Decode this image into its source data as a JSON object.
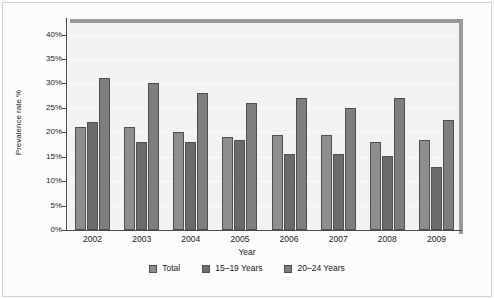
{
  "chart_data": {
    "type": "bar",
    "title": "",
    "subtitle": "",
    "xlabel": "Year",
    "ylabel": "Prevalence rate %",
    "categories": [
      "2002",
      "2003",
      "2004",
      "2005",
      "2006",
      "2007",
      "2008",
      "2009"
    ],
    "ytick_labels": [
      "0%",
      "5%",
      "10%",
      "15%",
      "20%",
      "25%",
      "30%",
      "35%",
      "40%"
    ],
    "ytick_values": [
      0,
      5,
      10,
      15,
      20,
      25,
      30,
      35,
      40
    ],
    "ylim": [
      0,
      43
    ],
    "grid": true,
    "legend_position": "bottom",
    "series": [
      {
        "name": "Total",
        "color": "#8e8e8e",
        "values": [
          21.0,
          21.0,
          20.0,
          19.0,
          19.5,
          19.5,
          18.0,
          18.5
        ]
      },
      {
        "name": "15–19 Years",
        "color": "#6b6b6b",
        "values": [
          22.2,
          18.0,
          18.0,
          18.5,
          15.5,
          15.5,
          15.2,
          13.0
        ]
      },
      {
        "name": "20–24 Years",
        "color": "#7e7e7e",
        "values": [
          31.2,
          30.2,
          28.0,
          26.0,
          27.0,
          25.0,
          27.0,
          22.5
        ]
      }
    ]
  },
  "legend": {
    "items": [
      {
        "label": "Total"
      },
      {
        "label": "15–19 Years"
      },
      {
        "label": "20–24 Years"
      }
    ]
  },
  "axes": {
    "y_title": "Prevalence rate %",
    "x_title": "Year"
  }
}
